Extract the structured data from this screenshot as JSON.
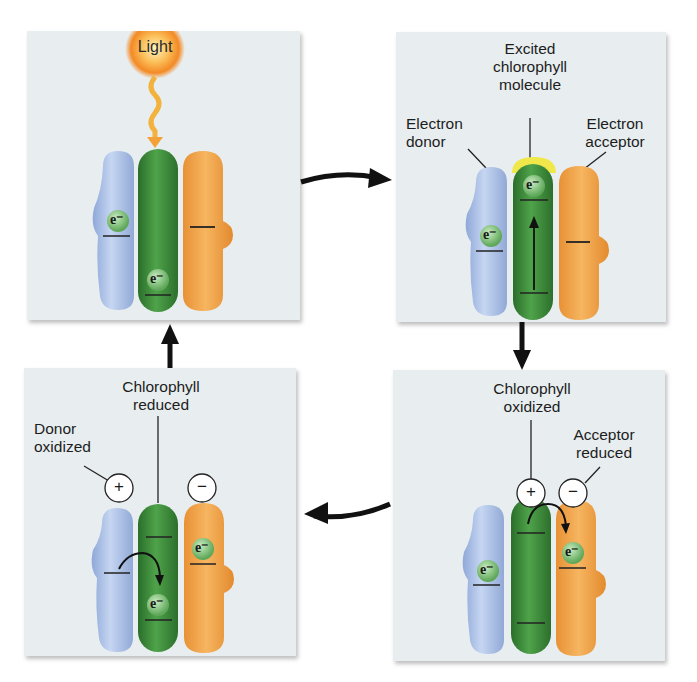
{
  "colors": {
    "panel_bg": "#e8eef0",
    "donor": "#a8bfe4",
    "chlorophyll": "#3c8a3a",
    "acceptor": "#efa44a",
    "electron": "#8fc98a",
    "light": "#f7a23a",
    "excited_glow": "#f0e84a",
    "arrow": "#111111"
  },
  "electron_symbol": "e⁻",
  "panels": [
    {
      "id": "step-1-light",
      "light_label": "Light",
      "labels": []
    },
    {
      "id": "step-2-excitation",
      "labels": [
        {
          "text_line1": "Excited",
          "text_line2": "chlorophyll",
          "text_line3": "molecule"
        },
        {
          "text_line1": "Electron",
          "text_line2": "donor"
        },
        {
          "text_line1": "Electron",
          "text_line2": "acceptor"
        }
      ]
    },
    {
      "id": "step-3-charge-separation",
      "labels": [
        {
          "text_line1": "Chlorophyll",
          "text_line2": "oxidized"
        },
        {
          "text_line1": "Acceptor",
          "text_line2": "reduced"
        }
      ],
      "charges": [
        "+",
        "−"
      ]
    },
    {
      "id": "step-4-reduction",
      "labels": [
        {
          "text_line1": "Chlorophyll",
          "text_line2": "reduced"
        },
        {
          "text_line1": "Donor",
          "text_line2": "oxidized"
        }
      ],
      "charges": [
        "+",
        "−"
      ]
    }
  ],
  "cycle_arrows": [
    "right",
    "down",
    "left",
    "up"
  ]
}
